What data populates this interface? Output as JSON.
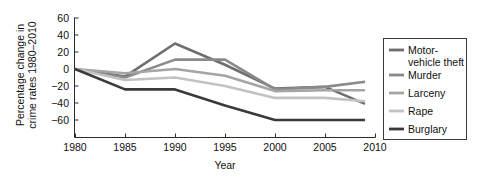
{
  "chart_data": {
    "type": "line",
    "title": "",
    "xlabel": "Year",
    "ylabel": "Percentage change in crime rates 1980–2010",
    "x": [
      1980,
      1985,
      1990,
      1995,
      2000,
      2005,
      2009
    ],
    "xlim": [
      1980,
      2010
    ],
    "ylim": [
      -70,
      60
    ],
    "xticks": [
      1980,
      1985,
      1990,
      1995,
      2000,
      2005,
      2010
    ],
    "xtick_labels": [
      "1980",
      "1985",
      "1990",
      "1995",
      "2000",
      "2005",
      "2010"
    ],
    "yticks": [
      60,
      40,
      20,
      0,
      -20,
      -40,
      -60
    ],
    "ytick_labels": [
      "60",
      "40",
      "20",
      "0",
      "−20",
      "−40",
      "−60"
    ],
    "grid": false,
    "legend_position": "right",
    "series": [
      {
        "name": "Motor-vehicle theft",
        "color": "#6e6e6e",
        "values": [
          0,
          -9,
          30,
          5,
          -23,
          -21,
          -41
        ]
      },
      {
        "name": "Murder",
        "color": "#8a8a8a",
        "values": [
          0,
          -10,
          11,
          11,
          -24,
          -21,
          -15
        ]
      },
      {
        "name": "Larceny",
        "color": "#a5a5a5",
        "values": [
          0,
          -5,
          0,
          -8,
          -26,
          -25,
          -25
        ]
      },
      {
        "name": "Rape",
        "color": "#c2c2c2",
        "values": [
          0,
          -13,
          -10,
          -20,
          -34,
          -34,
          -38
        ]
      },
      {
        "name": "Burglary",
        "color": "#3a3a3a",
        "values": [
          0,
          -24,
          -24,
          -43,
          -60,
          -60,
          -60
        ]
      }
    ]
  },
  "legend": {
    "entries": [
      {
        "label_line1": "Motor-",
        "label_line2": "vehicle theft"
      },
      {
        "label_line1": "Murder",
        "label_line2": ""
      },
      {
        "label_line1": "Larceny",
        "label_line2": ""
      },
      {
        "label_line1": "Rape",
        "label_line2": ""
      },
      {
        "label_line1": "Burglary",
        "label_line2": ""
      }
    ]
  },
  "axis": {
    "ylabel_line1": "Percentage change in",
    "ylabel_line2": "crime rates 1980–2010",
    "xlabel": "Year"
  }
}
